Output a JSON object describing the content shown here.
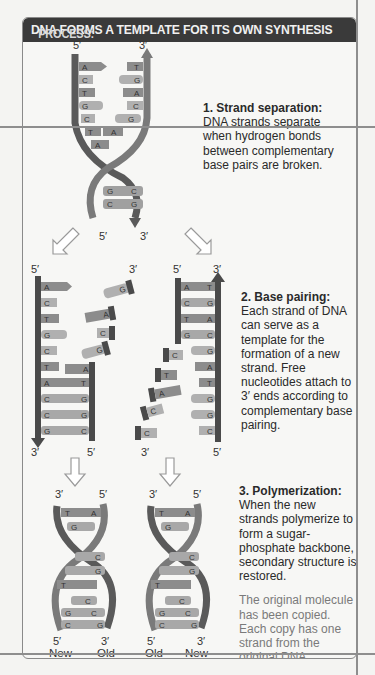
{
  "header": {
    "keyword": "PROCESS:",
    "title": "DNA FORMS A TEMPLATE FOR ITS OWN SYNTHESIS"
  },
  "steps": [
    {
      "title": "1. Strand separation:",
      "text": "DNA strands separate when hydrogen bonds between complementary base pairs are broken."
    },
    {
      "title": "2. Base pairing:",
      "text": "Each strand of DNA can serve as a template for the formation of a new strand. Free nucleotides attach to 3′ ends according to complementary base pairing."
    },
    {
      "title": "3. Polymerization:",
      "text": "When the new strands polymerize to form a sugar-phosphate backbone, secondary structure is restored.",
      "note": "The original molecule has been copied. Each copy has one strand from the original DNA molecule and one new strand."
    }
  ],
  "diagram": {
    "end_labels": {
      "five_prime": "5′",
      "three_prime": "3′"
    },
    "step1_bases_left": [
      "A",
      "C",
      "T",
      "G",
      "C",
      "T",
      "A"
    ],
    "step1_bases_right": [
      "T",
      "G",
      "A",
      "C",
      "G",
      "A"
    ],
    "step1_paired": [
      [
        "G",
        "C"
      ],
      [
        "C",
        "G"
      ]
    ],
    "step2_left_template": [
      "A",
      "C",
      "T",
      "G",
      "C",
      "T",
      "A",
      "C",
      "C",
      "G"
    ],
    "step2_left_new": [
      "T",
      "G",
      "G",
      "C"
    ],
    "step2_left_free": [
      "G",
      "A",
      "C",
      "G",
      "A"
    ],
    "step2_right_template": [
      "T",
      "G",
      "A",
      "C",
      "G",
      "A",
      "T",
      "G",
      "G",
      "C"
    ],
    "step2_right_new": [
      "A",
      "C",
      "T",
      "G"
    ],
    "step2_right_free": [
      "C",
      "T",
      "A",
      "C",
      "C"
    ],
    "step3_bottom_labels": [
      "New",
      "Old",
      "Old",
      "New"
    ],
    "colors": {
      "backbone_dark": "#5a5a5a",
      "base_mid": "#8c8c8c",
      "base_light": "#b0b0b0",
      "arrow_outline": "#9a9a9a"
    }
  }
}
